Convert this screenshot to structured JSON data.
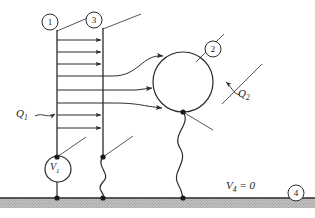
{
  "figure": {
    "type": "electrostatics-circuit-diagram",
    "background": "#ffffff",
    "stroke_color": "#2b2b2b",
    "ground_fill": "#b8b8b8"
  },
  "nodes": [
    {
      "id": "1",
      "label": "1",
      "x": 50,
      "y": 22,
      "r": 8,
      "leader_to": [
        62,
        34
      ]
    },
    {
      "id": "2",
      "label": "2",
      "x": 213,
      "y": 49,
      "r": 8,
      "leader_to": [
        196,
        62
      ]
    },
    {
      "id": "3",
      "label": "3",
      "x": 94,
      "y": 20,
      "r": 8,
      "leader_to": [
        108,
        33
      ]
    },
    {
      "id": "4",
      "label": "4",
      "x": 296,
      "y": 193,
      "r": 8,
      "leader_to": null
    }
  ],
  "labels": {
    "charge_1": "Q",
    "charge_1_sub": "1",
    "charge_2": "Q",
    "charge_2_sub": "2",
    "source_1": "V",
    "source_1_sub": "1",
    "ground_potential": "V",
    "ground_potential_sub": "4",
    "ground_potential_value": " = 0"
  },
  "plates": {
    "left_plate": {
      "x": 57,
      "y_top": 30,
      "y_bottom": 157,
      "node": "1"
    },
    "right_plate": {
      "x": 103,
      "y_top": 28,
      "y_bottom": 157,
      "node": "3"
    }
  },
  "sphere": {
    "cx": 183,
    "cy": 82,
    "r": 30,
    "node": "2"
  },
  "source": {
    "cx": 58,
    "cy": 169,
    "r": 13,
    "label": "V1"
  },
  "ground": {
    "y": 198,
    "height": 10,
    "x_start": 0,
    "x_end": 315
  },
  "terminals": [
    {
      "x": 57,
      "y": 157
    },
    {
      "x": 103,
      "y": 157
    },
    {
      "x": 183,
      "y": 112
    },
    {
      "x": 57,
      "y": 198
    },
    {
      "x": 103,
      "y": 198
    },
    {
      "x": 183,
      "y": 198
    }
  ],
  "field_lines": {
    "short_arrows_count": 5,
    "curved_to_sphere_count": 3,
    "description": "Electric field lines from plate 1 to plate 3 and curving to sphere 2"
  }
}
